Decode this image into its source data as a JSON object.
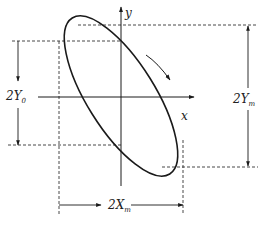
{
  "diagram": {
    "type": "lissajous-ellipse",
    "axes": {
      "x_label": "x",
      "y_label": "y"
    },
    "dimensions": {
      "y0": {
        "prefix": "2Y",
        "sub": "0"
      },
      "ym": {
        "prefix": "2Y",
        "sub": "m"
      },
      "xm": {
        "prefix": "2X",
        "sub": "m"
      }
    },
    "rotation": "clockwise",
    "colors": {
      "stroke": "#1a1a1a",
      "dash": "#333333",
      "background": "#ffffff"
    }
  }
}
